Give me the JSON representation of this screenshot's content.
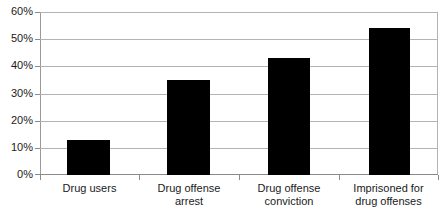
{
  "chart_data": {
    "type": "bar",
    "title": "",
    "subtitle": "",
    "xlabel": "",
    "ylabel": "",
    "categories": [
      "Drug users",
      "Drug offense arrest",
      "Drug offense conviction",
      "Imprisoned for drug offenses"
    ],
    "category_lines": [
      [
        "Drug users"
      ],
      [
        "Drug offense",
        "arrest"
      ],
      [
        "Drug offense",
        "conviction"
      ],
      [
        "Imprisoned for",
        "drug offenses"
      ]
    ],
    "values": [
      13,
      35,
      43,
      54
    ],
    "value_unit": "%",
    "ylim": [
      0,
      60
    ],
    "ytick_values": [
      0,
      10,
      20,
      30,
      40,
      50,
      60
    ],
    "ytick_labels": [
      "0%",
      "10%",
      "20%",
      "30%",
      "40%",
      "50%",
      "60%"
    ],
    "grid": true,
    "grid_axis": "y",
    "legend": false,
    "legend_position": "none",
    "bar_color": "#000000",
    "grid_color": "#b3b3b3",
    "axis_color": "#8a8a8a",
    "text_color": "#1a1a1a",
    "background_color": "#ffffff"
  }
}
